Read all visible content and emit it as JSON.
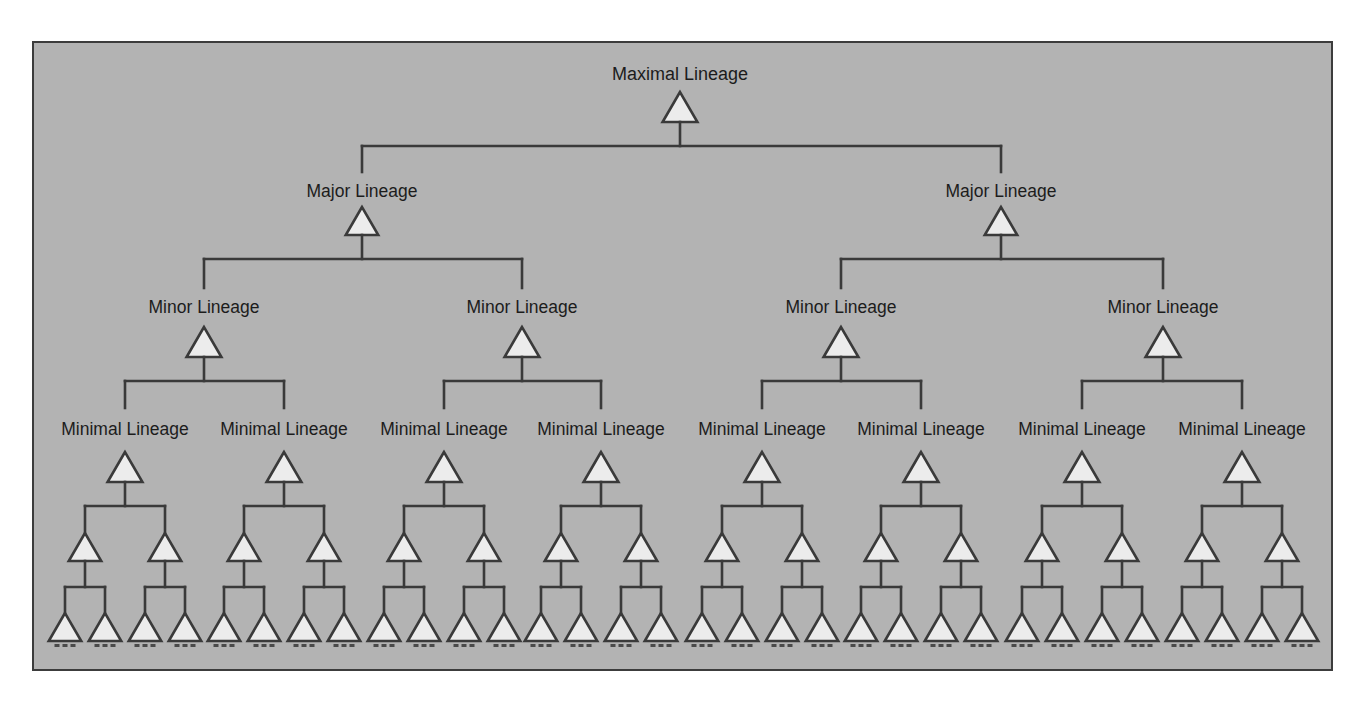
{
  "diagram": {
    "colors": {
      "background": "#b3b3b3",
      "frame_border": "#3c3c3c",
      "line": "#3a3a3a",
      "triangle_fill": "#ececec",
      "text": "#1c1c1c"
    },
    "levels": [
      {
        "name": "maximal",
        "label": "Maximal Lineage",
        "count": 1,
        "labeled": true
      },
      {
        "name": "major",
        "label": "Major Lineage",
        "count": 2,
        "labeled": true
      },
      {
        "name": "minor",
        "label": "Minor Lineage",
        "count": 4,
        "labeled": true
      },
      {
        "name": "minimal",
        "label": "Minimal Lineage",
        "count": 8,
        "labeled": true
      },
      {
        "name": "sub",
        "label": "",
        "count": 16,
        "labeled": false
      },
      {
        "name": "leaf",
        "label": "",
        "count": 32,
        "labeled": false
      }
    ],
    "leaf_continuation": "..."
  },
  "layout": {
    "maximal": {
      "x": [
        680
      ],
      "label_y": 80,
      "tri_top": 92,
      "tri_bottom": 122,
      "bar_y": 146,
      "font": 18
    },
    "major": {
      "x": [
        362,
        1001
      ],
      "label_y": 197,
      "drop_top": 146,
      "drop_bottom": 172,
      "tri_top": 207,
      "tri_bottom": 235,
      "bar_y": 259,
      "font": 17.5
    },
    "minor": {
      "x": [
        204,
        522,
        841,
        1163
      ],
      "label_y": 313,
      "drop_top": 259,
      "drop_bottom": 288,
      "tri_top": 327,
      "tri_bottom": 357,
      "bar_y": 381,
      "font": 17.5
    },
    "minimal": {
      "x": [
        125,
        284,
        444,
        601,
        762,
        921,
        1082,
        1242
      ],
      "label_y": 435,
      "drop_top": 381,
      "drop_bottom": 408,
      "tri_top": 452,
      "tri_bottom": 482,
      "bar_y": 506,
      "font": 17.5
    },
    "sub": {
      "offset": 40,
      "drop_top": 506,
      "tri_top": 533,
      "tri_bottom": 561,
      "bar_y": 587
    },
    "leaf": {
      "offset": 20,
      "drop_top": 587,
      "tri_top": 613,
      "tri_bottom": 641,
      "dash_y": 644
    }
  }
}
